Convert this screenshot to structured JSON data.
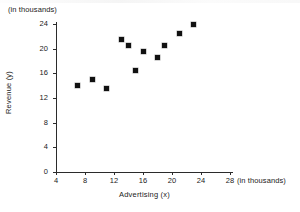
{
  "chart_data": {
    "type": "scatter",
    "title": "",
    "xlabel": "Advertising (x)",
    "ylabel": "Revenue (y)",
    "x_unit_note": "(in thousands)",
    "y_unit_note": "(in thousands)",
    "xlim": [
      4,
      30
    ],
    "ylim": [
      0,
      25
    ],
    "xticks": [
      4,
      8,
      12,
      16,
      20,
      24,
      28
    ],
    "yticks": [
      0,
      4,
      8,
      12,
      16,
      20,
      24
    ],
    "grid": false,
    "legend": null,
    "marker": "filled-square",
    "marker_color": "#111111",
    "points": [
      {
        "x": 7,
        "y": 14.0
      },
      {
        "x": 9,
        "y": 15.0
      },
      {
        "x": 11,
        "y": 13.5
      },
      {
        "x": 13,
        "y": 21.5
      },
      {
        "x": 14,
        "y": 20.5
      },
      {
        "x": 15,
        "y": 16.5
      },
      {
        "x": 16,
        "y": 19.5
      },
      {
        "x": 18,
        "y": 18.5
      },
      {
        "x": 19,
        "y": 20.5
      },
      {
        "x": 21,
        "y": 22.5
      },
      {
        "x": 23,
        "y": 24.0
      }
    ]
  },
  "axes": {
    "y_tick_labels": [
      "24",
      "20",
      "16",
      "12",
      "8",
      "4",
      "0"
    ],
    "x_tick_labels": [
      "4",
      "8",
      "12",
      "16",
      "20",
      "24",
      "28"
    ]
  },
  "annotations": {
    "top_left_unit": "(in thousands)",
    "bottom_right_unit": "(in thousands)"
  }
}
